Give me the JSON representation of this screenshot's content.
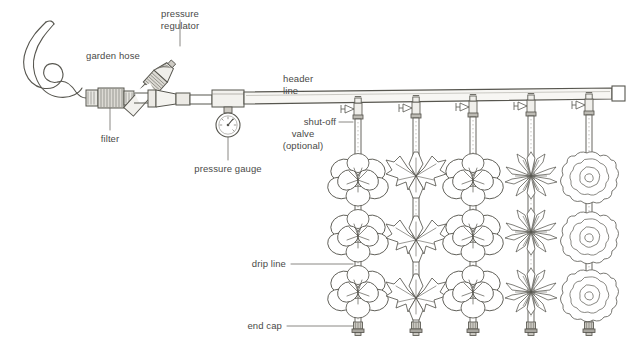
{
  "figure": {
    "background_color": "#ffffff",
    "ink_color": "#4a4a48",
    "line_color": "#55544f",
    "width": 643,
    "height": 356
  },
  "labels": {
    "garden_hose": "garden hose",
    "pressure_regulator_line1": "pressure",
    "pressure_regulator_line2": "regulator",
    "filter": "filter",
    "pressure_gauge": "pressure gauge",
    "header_line_line1": "header",
    "header_line_line2": "line",
    "shutoff_line1": "shut-off",
    "shutoff_line2": "valve",
    "shutoff_line3": "(optional)",
    "drip_line": "drip line",
    "end_cap": "end cap"
  },
  "components": {
    "garden_hose": {
      "name": "garden hose",
      "shape": "coiled-hose"
    },
    "filter": {
      "name": "filter",
      "shape": "knurled-cylinder"
    },
    "pressure_regulator": {
      "name": "pressure regulator",
      "shape": "angled-cone-fitting"
    },
    "pressure_gauge": {
      "name": "pressure gauge",
      "shape": "round-dial",
      "mounted_on": "tee"
    },
    "header_line": {
      "name": "header line",
      "shape": "horizontal-pipe",
      "terminates_in": "square end cap"
    },
    "shutoff_valves": {
      "name": "shut-off valve (optional)",
      "count": 5,
      "shape": "gate-valve-with-handwheel"
    },
    "drip_lines": {
      "name": "drip line",
      "count": 5,
      "shape": "vertical-tube-with-emitters"
    },
    "end_caps": {
      "name": "end cap",
      "count": 5,
      "shape": "ribbed-plug"
    }
  },
  "plant_columns": [
    {
      "index": 1,
      "type": "round-petal-flower",
      "blooms": 3,
      "center_x": 358
    },
    {
      "index": 2,
      "type": "pointed-leaf-flower",
      "blooms": 3,
      "center_x": 416
    },
    {
      "index": 3,
      "type": "round-petal-flower",
      "blooms": 3,
      "center_x": 473
    },
    {
      "index": 4,
      "type": "narrow-spiky-aster",
      "blooms": 3,
      "center_x": 531
    },
    {
      "index": 5,
      "type": "ruffled-concentric-bloom",
      "blooms": 3,
      "center_x": 589
    }
  ]
}
